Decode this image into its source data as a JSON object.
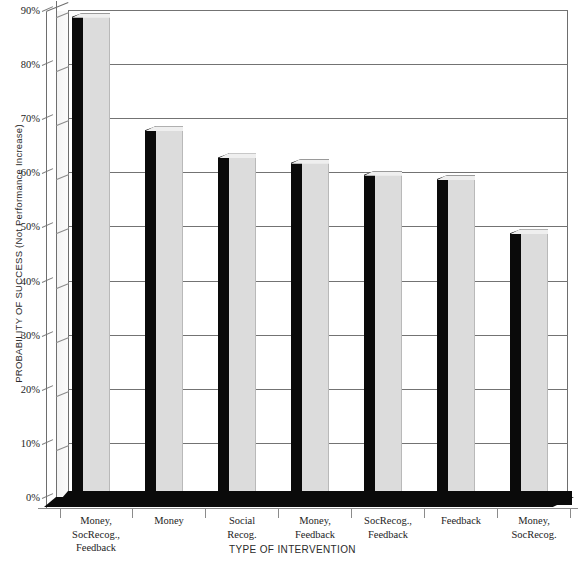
{
  "chart_data": {
    "type": "bar",
    "title": "",
    "xlabel": "TYPE OF INTERVENTION",
    "ylabel": "PROBABILITY OF SUCCESS (Not Performance Increase)",
    "ylim": [
      0,
      90
    ],
    "grid": true,
    "legend": null,
    "style": "3d-column",
    "categories": [
      "Money,\nSocRecog.,\nFeedback",
      "Money",
      "Social\nRecog.",
      "Money,\nFeedback",
      "SocRecog.,\nFeedback",
      "Feedback",
      "Money,\nSocRecog."
    ],
    "values": [
      89.5,
      68.5,
      63.5,
      62.5,
      60.3,
      59.5,
      49.5
    ],
    "ytick_labels": [
      "90%",
      "80%",
      "70%",
      "60%",
      "50%",
      "40%",
      "30%",
      "20%",
      "10%",
      "0%"
    ],
    "ytick_values": [
      90,
      80,
      70,
      60,
      50,
      40,
      30,
      20,
      10,
      0
    ],
    "colors": {
      "bar_front": "#dcdcdc",
      "bar_side": "#0a0a0a",
      "bar_top": "#efefef",
      "gridline": "#737373",
      "axis": "#6e6e6e",
      "floor": "#0a0a0a",
      "background": "#ffffff",
      "text": "#1d1d1d"
    }
  }
}
